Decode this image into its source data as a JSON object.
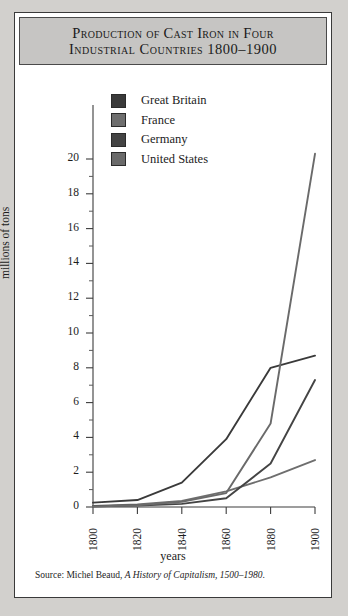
{
  "figure": {
    "title_line_1": "Production of Cast Iron in Four",
    "title_line_2": "Industrial Countries   1800–1900",
    "source_prefix": "Source: Michel Beaud, ",
    "source_italic": "A History of Capitalism, 1500–1980",
    "source_suffix": "."
  },
  "legend": {
    "position": "inside-top-left",
    "items": [
      {
        "label": "Great Britain",
        "color": "#3a3a3a"
      },
      {
        "label": "France",
        "color": "#6e6e6e"
      },
      {
        "label": "Germany",
        "color": "#444444"
      },
      {
        "label": "United States",
        "color": "#6a6a6a"
      }
    ]
  },
  "chart_data": {
    "type": "line",
    "title": "Production of Cast Iron in Four Industrial Countries 1800–1900",
    "xlabel": "years",
    "ylabel": "millions of tons",
    "x": [
      1800,
      1820,
      1840,
      1860,
      1880,
      1900
    ],
    "xtick_labels": [
      "1800",
      "1820",
      "1840",
      "1860",
      "1880",
      "1900"
    ],
    "ytick_labels": [
      "0",
      "2",
      "4",
      "6",
      "8",
      "10",
      "12",
      "14",
      "16",
      "18",
      "20"
    ],
    "ytick_values": [
      0,
      2,
      4,
      6,
      8,
      10,
      12,
      14,
      16,
      18,
      20
    ],
    "yminor_values": [
      1,
      3,
      5,
      7,
      9,
      11,
      13,
      15,
      17,
      19
    ],
    "xlim": [
      1800,
      1900
    ],
    "ylim": [
      0,
      20
    ],
    "grid": false,
    "series": [
      {
        "name": "Great Britain",
        "color": "#3a3a3a",
        "values": [
          0.25,
          0.4,
          1.4,
          3.9,
          8.0,
          8.7
        ]
      },
      {
        "name": "France",
        "color": "#6e6e6e",
        "values": [
          0.06,
          0.14,
          0.35,
          0.9,
          1.7,
          2.7
        ]
      },
      {
        "name": "Germany",
        "color": "#444444",
        "values": [
          0.04,
          0.09,
          0.18,
          0.5,
          2.5,
          7.3
        ]
      },
      {
        "name": "United States",
        "color": "#6a6a6a",
        "values": [
          0.03,
          0.1,
          0.3,
          0.8,
          4.8,
          20.3
        ]
      }
    ]
  },
  "axes": {
    "y_axis_name": "y-axis",
    "x_axis_name": "x-axis"
  }
}
